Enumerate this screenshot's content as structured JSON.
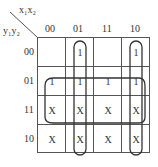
{
  "kmap": {
    "col_var": "x₁x₂",
    "row_var": "y₁y₂",
    "col_labels": [
      "00",
      "01",
      "11",
      "10"
    ],
    "row_labels": [
      "00",
      "01",
      "11",
      "10"
    ],
    "cells": [
      [
        "",
        "1",
        "",
        "1"
      ],
      [
        "1",
        "1",
        "1",
        "1"
      ],
      [
        "X",
        "X",
        "X",
        "X"
      ],
      [
        "X",
        "X",
        "X",
        "X"
      ]
    ],
    "groups": [
      {
        "name": "column-01",
        "desc": "x1'x2 column"
      },
      {
        "name": "column-10",
        "desc": "x1x2' column"
      },
      {
        "name": "rows-01-11",
        "desc": "y2 rows"
      }
    ]
  }
}
